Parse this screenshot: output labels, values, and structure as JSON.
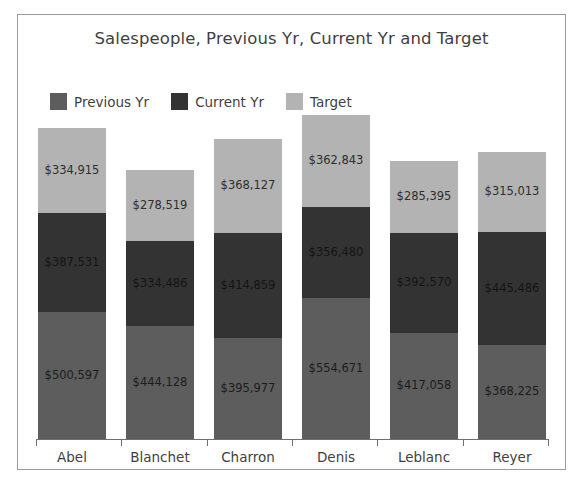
{
  "chart_data": {
    "type": "bar",
    "subtype": "stacked-bar",
    "title": "Salespeople, Previous Yr, Current Yr and Target",
    "xlabel": "",
    "ylabel": "",
    "grid": false,
    "legend_position": "top-left",
    "axis_visible": true,
    "value_labels": true,
    "categories": [
      "Abel",
      "Blanchet",
      "Charron",
      "Denis",
      "Leblanc",
      "Reyer"
    ],
    "series": [
      {
        "name": "Previous Yr",
        "color": "#5d5d5d",
        "stack_order": 0,
        "values": [
          500597,
          444128,
          395977,
          554671,
          417058,
          368225
        ],
        "labels": [
          "$500,597",
          "$444,128",
          "$395,977",
          "$554,671",
          "$417,058",
          "$368,225"
        ]
      },
      {
        "name": "Current Yr",
        "color": "#333333",
        "stack_order": 1,
        "values": [
          387531,
          334486,
          414859,
          356480,
          392570,
          445486
        ],
        "labels": [
          "$387,531",
          "$334,486",
          "$414,859",
          "$356,480",
          "$392,570",
          "$445,486"
        ]
      },
      {
        "name": "Target",
        "color": "#b3b3b3",
        "stack_order": 2,
        "values": [
          334915,
          278519,
          368127,
          362843,
          285395,
          315013
        ],
        "labels": [
          "$334,915",
          "$278,519",
          "$368,127",
          "$362,843",
          "$285,395",
          "$315,013"
        ]
      }
    ],
    "totals": [
      1223043,
      1057133,
      1178963,
      1273994,
      1095023,
      1128724
    ],
    "ylim": [
      0,
      1273994
    ]
  },
  "legend": {
    "items": [
      {
        "label": "Previous Yr",
        "color": "#5d5d5d"
      },
      {
        "label": "Current Yr",
        "color": "#333333"
      },
      {
        "label": "Target",
        "color": "#b3b3b3"
      }
    ]
  },
  "colors": {
    "previous_yr": "#5d5d5d",
    "current_yr": "#333333",
    "target": "#b3b3b3",
    "frame_border": "#9a9a9a",
    "axis": "#6f6f6f",
    "text": "#3f3f3f",
    "background": "#ffffff"
  }
}
